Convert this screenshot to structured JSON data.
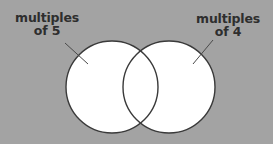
{
  "diagram": {
    "type": "venn",
    "background": "#a3a3a3",
    "circle_fill": "#ffffff",
    "stroke": "#3a3a3a",
    "sets": [
      {
        "id": "multiples-of-5",
        "label_line1": "multiples",
        "label_line2": "of 5",
        "cx": 112,
        "cy": 87,
        "r": 46,
        "leader": {
          "x1": 65,
          "y1": 43,
          "x2": 88,
          "y2": 64
        }
      },
      {
        "id": "multiples-of-4",
        "label_line1": "multiples",
        "label_line2": "of 4",
        "cx": 169,
        "cy": 87,
        "r": 46,
        "leader": {
          "x1": 213,
          "y1": 40,
          "x2": 193,
          "y2": 64
        }
      }
    ]
  }
}
